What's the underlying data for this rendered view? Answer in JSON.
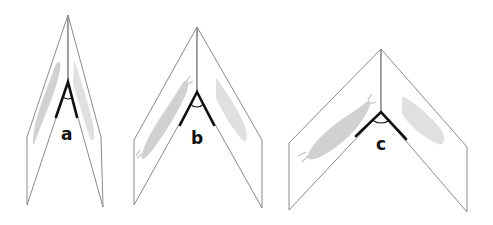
{
  "figures": [
    {
      "id": "a",
      "label": "a",
      "description": "narrow fold angle between two mirror panels"
    },
    {
      "id": "b",
      "label": "b",
      "description": "medium fold angle between two mirror panels"
    },
    {
      "id": "c",
      "label": "c",
      "description": "wide fold angle between two mirror panels"
    }
  ],
  "colors": {
    "panel_edge": "#8a8a8a",
    "angle_mark": "#111111",
    "illustration": "#c9c9c9",
    "background": "#ffffff"
  }
}
